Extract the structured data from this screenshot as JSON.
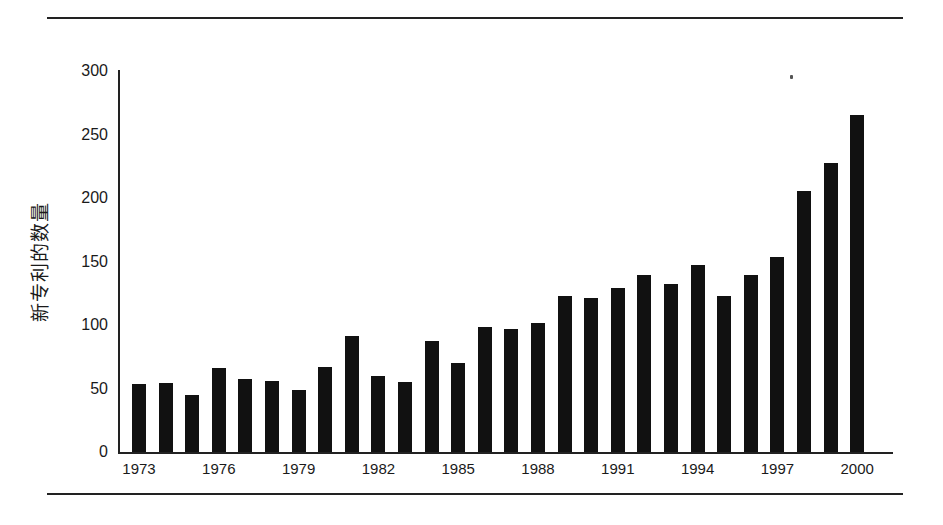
{
  "chart_data": {
    "type": "bar",
    "title": "",
    "xlabel": "",
    "ylabel": "新专利的数量",
    "ylim": [
      0,
      300
    ],
    "grid": false,
    "legend": null,
    "categories": [
      "1973",
      "1974",
      "1975",
      "1976",
      "1977",
      "1978",
      "1979",
      "1980",
      "1981",
      "1982",
      "1983",
      "1984",
      "1985",
      "1986",
      "1987",
      "1988",
      "1989",
      "1990",
      "1991",
      "1992",
      "1993",
      "1994",
      "1995",
      "1996",
      "1997",
      "1998",
      "1999",
      "2000"
    ],
    "values": [
      54,
      55,
      46,
      67,
      58,
      57,
      50,
      68,
      92,
      61,
      56,
      88,
      71,
      99,
      98,
      102,
      124,
      122,
      130,
      140,
      133,
      148,
      124,
      140,
      154,
      206,
      228,
      266
    ],
    "y_ticks": [
      "0",
      "50",
      "100",
      "150",
      "200",
      "250",
      "300"
    ],
    "x_tick_labels": [
      "1973",
      "1976",
      "1979",
      "1982",
      "1985",
      "1988",
      "1991",
      "1994",
      "1997",
      "2000"
    ],
    "bar_color": "#111111"
  }
}
